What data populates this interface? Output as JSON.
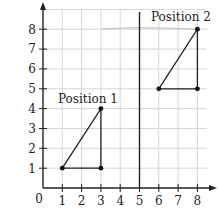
{
  "diagram": {
    "type": "coordinate-grid-translation",
    "x_axis": {
      "ticks": [
        "1",
        "2",
        "3",
        "4",
        "5",
        "6",
        "7",
        "8"
      ],
      "origin_label": "0"
    },
    "y_axis": {
      "ticks": [
        "1",
        "2",
        "3",
        "4",
        "5",
        "6",
        "7",
        "8"
      ]
    },
    "divider_line_x": 5,
    "shapes": [
      {
        "label": "Position 1",
        "vertices": [
          [
            1,
            1
          ],
          [
            3,
            1
          ],
          [
            3,
            4
          ]
        ]
      },
      {
        "label": "Position 2",
        "vertices": [
          [
            6,
            5
          ],
          [
            8,
            5
          ],
          [
            8,
            8
          ]
        ]
      }
    ],
    "colors": {
      "grid": "#d6d6d6",
      "axis": "#222222",
      "shape": "#222222"
    }
  },
  "labels": {
    "position1": "Position 1",
    "position2": "Position 2",
    "origin": "0",
    "x1": "1",
    "x2": "2",
    "x3": "3",
    "x4": "4",
    "x5": "5",
    "x6": "6",
    "x7": "7",
    "x8": "8",
    "y1": "1",
    "y2": "2",
    "y3": "3",
    "y4": "4",
    "y5": "5",
    "y6": "6",
    "y7": "7",
    "y8": "8"
  }
}
